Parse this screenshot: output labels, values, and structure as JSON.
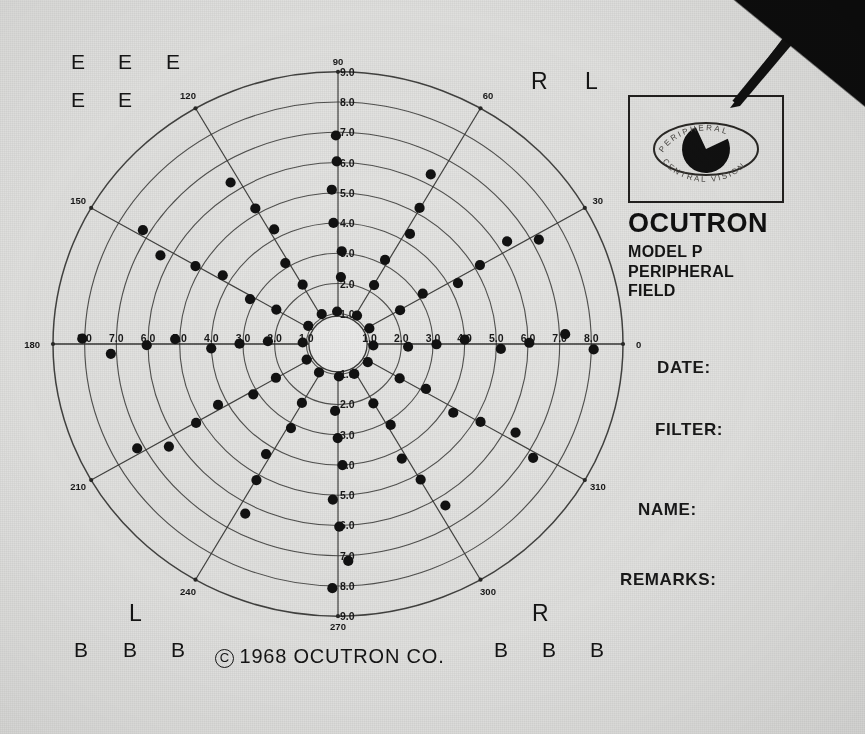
{
  "document": {
    "title": "OCUTRON Model P Peripheral Field chart",
    "copyright": "1968 OCUTRON CO.",
    "copyright_symbol": "C"
  },
  "brand_panel": {
    "logo_icon": "eye-with-probe-icon",
    "logo_ring_top_text": "PERIPHERAL",
    "logo_ring_bottom_text": "CENTRAL VISION",
    "brand": "OCUTRON",
    "model": "MODEL P",
    "line2": "PERIPHERAL",
    "line3": "FIELD"
  },
  "form_fields": [
    {
      "id": "date",
      "label": "DATE:",
      "value": ""
    },
    {
      "id": "filter",
      "label": "FILTER:",
      "value": ""
    },
    {
      "id": "name",
      "label": "NAME:",
      "value": ""
    },
    {
      "id": "remarks",
      "label": "REMARKS:",
      "value": ""
    }
  ],
  "corner_marks": {
    "top_left_row1": [
      "E",
      "E",
      "E"
    ],
    "top_left_row2": [
      "E",
      "E"
    ],
    "top_right": [
      "R",
      "L"
    ],
    "bottom_left_letter": "L",
    "bottom_left_row": [
      "B",
      "B",
      "B"
    ],
    "bottom_right_letter": "R",
    "bottom_right_row": [
      "B",
      "B",
      "B"
    ]
  },
  "chart_data": {
    "type": "scatter",
    "title": "OCUTRON MODEL P PERIPHERAL FIELD",
    "projection": "polar",
    "grid": true,
    "legend": false,
    "rlim": [
      0,
      9
    ],
    "r_ticks": [
      "1.0",
      "2.0",
      "3.0",
      "4.0",
      "5.0",
      "6.0",
      "7.0",
      "8.0",
      "9.0"
    ],
    "r_tick_labels_axes": [
      "up",
      "down",
      "left",
      "right"
    ],
    "angle_tick_labels": [
      "0",
      "30",
      "60",
      "90",
      "120",
      "150",
      "180",
      "210",
      "240",
      "270",
      "300",
      "310"
    ],
    "angle_ticks_deg": [
      0,
      30,
      60,
      90,
      120,
      150,
      180,
      210,
      240,
      270,
      300,
      330
    ],
    "spokes_deg": [
      0,
      30,
      60,
      90,
      120,
      150,
      180,
      210,
      240,
      270,
      300,
      330
    ],
    "rings": [
      1,
      2,
      3,
      4,
      5,
      6,
      7,
      8,
      9
    ],
    "xlabel": "",
    "ylabel": "",
    "marker": "filled-circle",
    "marker_color": "#121212",
    "series": [
      {
        "name": "measured peripheral field points",
        "points_polar": [
          {
            "angle": 0,
            "r": 1.2
          },
          {
            "angle": 0,
            "r": 2.1
          },
          {
            "angle": 0,
            "r": 3.1
          },
          {
            "angle": 0,
            "r": 4.1
          },
          {
            "angle": 0,
            "r": 5.1
          },
          {
            "angle": 0,
            "r": 6.1
          },
          {
            "angle": 0,
            "r": 7.1
          },
          {
            "angle": 0,
            "r": 8.1
          },
          {
            "angle": 30,
            "r": 1.2
          },
          {
            "angle": 30,
            "r": 2.2
          },
          {
            "angle": 30,
            "r": 3.2
          },
          {
            "angle": 30,
            "r": 4.2
          },
          {
            "angle": 30,
            "r": 5.2
          },
          {
            "angle": 30,
            "r": 6.2
          },
          {
            "angle": 30,
            "r": 7.2
          },
          {
            "angle": 60,
            "r": 1.2
          },
          {
            "angle": 60,
            "r": 2.2
          },
          {
            "angle": 60,
            "r": 3.2
          },
          {
            "angle": 60,
            "r": 4.2
          },
          {
            "angle": 60,
            "r": 5.2
          },
          {
            "angle": 60,
            "r": 6.2
          },
          {
            "angle": 90,
            "r": 1.1
          },
          {
            "angle": 90,
            "r": 2.1
          },
          {
            "angle": 90,
            "r": 3.0
          },
          {
            "angle": 90,
            "r": 4.1
          },
          {
            "angle": 90,
            "r": 5.0
          },
          {
            "angle": 90,
            "r": 6.1
          },
          {
            "angle": 90,
            "r": 7.0
          },
          {
            "angle": 120,
            "r": 1.2
          },
          {
            "angle": 120,
            "r": 2.2
          },
          {
            "angle": 120,
            "r": 3.2
          },
          {
            "angle": 120,
            "r": 4.2
          },
          {
            "angle": 120,
            "r": 5.2
          },
          {
            "angle": 120,
            "r": 6.2
          },
          {
            "angle": 150,
            "r": 1.2
          },
          {
            "angle": 150,
            "r": 2.2
          },
          {
            "angle": 150,
            "r": 3.2
          },
          {
            "angle": 150,
            "r": 4.2
          },
          {
            "angle": 150,
            "r": 5.2
          },
          {
            "angle": 150,
            "r": 6.2
          },
          {
            "angle": 150,
            "r": 7.2
          },
          {
            "angle": 180,
            "r": 1.2
          },
          {
            "angle": 180,
            "r": 2.1
          },
          {
            "angle": 180,
            "r": 3.1
          },
          {
            "angle": 180,
            "r": 4.1
          },
          {
            "angle": 180,
            "r": 5.1
          },
          {
            "angle": 180,
            "r": 6.1
          },
          {
            "angle": 180,
            "r": 7.1
          },
          {
            "angle": 180,
            "r": 8.1
          },
          {
            "angle": 210,
            "r": 1.2
          },
          {
            "angle": 210,
            "r": 2.2
          },
          {
            "angle": 210,
            "r": 3.2
          },
          {
            "angle": 210,
            "r": 4.2
          },
          {
            "angle": 210,
            "r": 5.2
          },
          {
            "angle": 210,
            "r": 6.2
          },
          {
            "angle": 210,
            "r": 7.2
          },
          {
            "angle": 240,
            "r": 1.2
          },
          {
            "angle": 240,
            "r": 2.2
          },
          {
            "angle": 240,
            "r": 3.2
          },
          {
            "angle": 240,
            "r": 4.2
          },
          {
            "angle": 240,
            "r": 5.2
          },
          {
            "angle": 240,
            "r": 6.2
          },
          {
            "angle": 270,
            "r": 1.1
          },
          {
            "angle": 270,
            "r": 2.1
          },
          {
            "angle": 270,
            "r": 3.1
          },
          {
            "angle": 270,
            "r": 4.1
          },
          {
            "angle": 270,
            "r": 5.1
          },
          {
            "angle": 270,
            "r": 6.1
          },
          {
            "angle": 270,
            "r": 7.1
          },
          {
            "angle": 270,
            "r": 8.1
          },
          {
            "angle": 300,
            "r": 1.2
          },
          {
            "angle": 300,
            "r": 2.2
          },
          {
            "angle": 300,
            "r": 3.2
          },
          {
            "angle": 300,
            "r": 4.2
          },
          {
            "angle": 300,
            "r": 5.2
          },
          {
            "angle": 300,
            "r": 6.2
          },
          {
            "angle": 330,
            "r": 1.2
          },
          {
            "angle": 330,
            "r": 2.2
          },
          {
            "angle": 330,
            "r": 3.2
          },
          {
            "angle": 330,
            "r": 4.2
          },
          {
            "angle": 330,
            "r": 5.2
          },
          {
            "angle": 330,
            "r": 6.2
          },
          {
            "angle": 330,
            "r": 7.2
          }
        ]
      }
    ]
  }
}
